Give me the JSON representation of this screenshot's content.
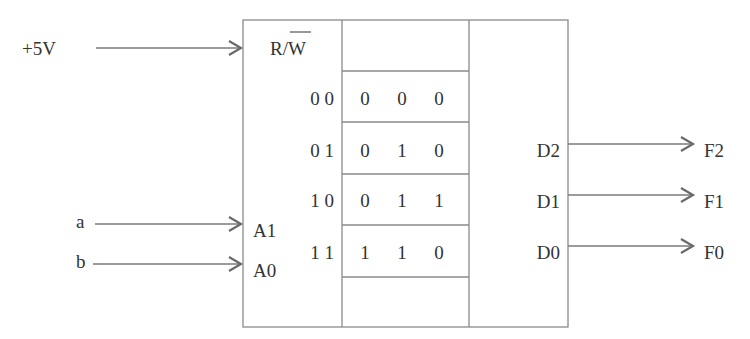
{
  "inputs": {
    "power": {
      "label": "+5V",
      "target": "R/W"
    },
    "a": {
      "label": "a",
      "target": "A1"
    },
    "b": {
      "label": "b",
      "target": "A0"
    }
  },
  "chip": {
    "rw_label_r": "R/",
    "rw_label_w": "W",
    "address_pins": [
      "A1",
      "A0"
    ],
    "data_pins": [
      "D2",
      "D1",
      "D0"
    ]
  },
  "memory": {
    "addresses": [
      "0 0",
      "0 1",
      "1 0",
      "1 1"
    ],
    "rows": [
      [
        "0",
        "0",
        "0"
      ],
      [
        "0",
        "1",
        "0"
      ],
      [
        "0",
        "1",
        "1"
      ],
      [
        "1",
        "1",
        "0"
      ]
    ]
  },
  "outputs": [
    "F2",
    "F1",
    "F0"
  ]
}
